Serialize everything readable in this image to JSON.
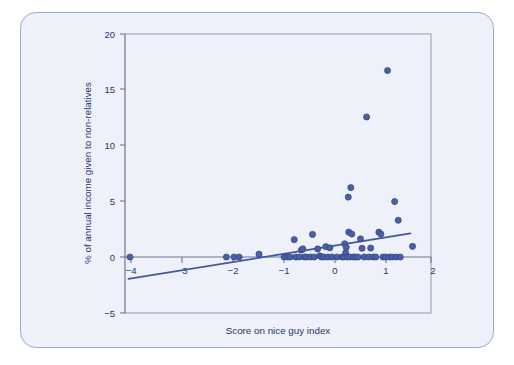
{
  "figure": {
    "background_color": "#eef1f9",
    "border_color": "#9aa8d6",
    "marker_color": "#4a5fa5",
    "marker_edge_color": "#2c3c78",
    "trendline_color": "#45589e",
    "axis_color": "#6d7590",
    "text_color": "#28356b"
  },
  "chart_data": {
    "type": "scatter",
    "title": "",
    "xlabel": "Score on nice guy index",
    "ylabel": "% of annual income given to non-relatives",
    "xlim": [
      -4.2,
      2.0
    ],
    "ylim": [
      -5,
      20
    ],
    "xticks": [
      -4,
      -3,
      -2,
      -1,
      0,
      1,
      2
    ],
    "xtick_labels": [
      "−4",
      "−3",
      "−2",
      "−1",
      "0",
      "1",
      "2"
    ],
    "yticks": [
      -5,
      0,
      5,
      10,
      15,
      20
    ],
    "ytick_labels": [
      "−5",
      "0",
      "5",
      "10",
      "15",
      "20"
    ],
    "grid": false,
    "legend": null,
    "points": [
      {
        "x": -4.02,
        "y": 0.0
      },
      {
        "x": -2.13,
        "y": 0.0
      },
      {
        "x": -1.98,
        "y": 0.0
      },
      {
        "x": -1.88,
        "y": 0.0
      },
      {
        "x": -1.49,
        "y": 0.25
      },
      {
        "x": -1.0,
        "y": 0.0
      },
      {
        "x": -0.93,
        "y": 0.0
      },
      {
        "x": -0.88,
        "y": 0.0
      },
      {
        "x": -0.8,
        "y": 1.55
      },
      {
        "x": -0.77,
        "y": 0.0
      },
      {
        "x": -0.7,
        "y": 0.0
      },
      {
        "x": -0.66,
        "y": 0.62
      },
      {
        "x": -0.63,
        "y": 0.72
      },
      {
        "x": -0.6,
        "y": 0.0
      },
      {
        "x": -0.56,
        "y": 0.0
      },
      {
        "x": -0.48,
        "y": 0.0
      },
      {
        "x": -0.44,
        "y": 2.02
      },
      {
        "x": -0.41,
        "y": 0.0
      },
      {
        "x": -0.34,
        "y": 0.72
      },
      {
        "x": -0.3,
        "y": 0.1
      },
      {
        "x": -0.26,
        "y": 0.0
      },
      {
        "x": -0.22,
        "y": 0.0
      },
      {
        "x": -0.18,
        "y": 0.92
      },
      {
        "x": -0.14,
        "y": 0.0
      },
      {
        "x": -0.1,
        "y": 0.82
      },
      {
        "x": -0.06,
        "y": 0.0
      },
      {
        "x": 0.04,
        "y": 0.0
      },
      {
        "x": 0.14,
        "y": 0.0
      },
      {
        "x": 0.17,
        "y": 0.0
      },
      {
        "x": 0.19,
        "y": 1.18
      },
      {
        "x": 0.21,
        "y": 0.38
      },
      {
        "x": 0.22,
        "y": 0.86
      },
      {
        "x": 0.24,
        "y": 0.0
      },
      {
        "x": 0.26,
        "y": 5.35
      },
      {
        "x": 0.27,
        "y": 2.22
      },
      {
        "x": 0.29,
        "y": 0.0
      },
      {
        "x": 0.31,
        "y": 6.2
      },
      {
        "x": 0.33,
        "y": 2.05
      },
      {
        "x": 0.36,
        "y": 0.0
      },
      {
        "x": 0.4,
        "y": 0.0
      },
      {
        "x": 0.45,
        "y": 0.0
      },
      {
        "x": 0.5,
        "y": 1.62
      },
      {
        "x": 0.53,
        "y": 0.78
      },
      {
        "x": 0.57,
        "y": 0.0
      },
      {
        "x": 0.62,
        "y": 12.5
      },
      {
        "x": 0.66,
        "y": 0.0
      },
      {
        "x": 0.7,
        "y": 0.8
      },
      {
        "x": 0.75,
        "y": 0.0
      },
      {
        "x": 0.8,
        "y": 0.0
      },
      {
        "x": 0.86,
        "y": 2.22
      },
      {
        "x": 0.9,
        "y": 2.05
      },
      {
        "x": 0.94,
        "y": 0.0
      },
      {
        "x": 0.99,
        "y": 0.0
      },
      {
        "x": 1.03,
        "y": 16.65
      },
      {
        "x": 1.07,
        "y": 0.0
      },
      {
        "x": 1.12,
        "y": 0.0
      },
      {
        "x": 1.17,
        "y": 4.95
      },
      {
        "x": 1.2,
        "y": 0.0
      },
      {
        "x": 1.24,
        "y": 3.28
      },
      {
        "x": 1.28,
        "y": 0.0
      },
      {
        "x": 1.52,
        "y": 0.95
      }
    ],
    "trendline": {
      "label": "linear fit",
      "x_start": -4.05,
      "y_start": -1.95,
      "x_end": 1.48,
      "y_end": 2.1
    }
  }
}
